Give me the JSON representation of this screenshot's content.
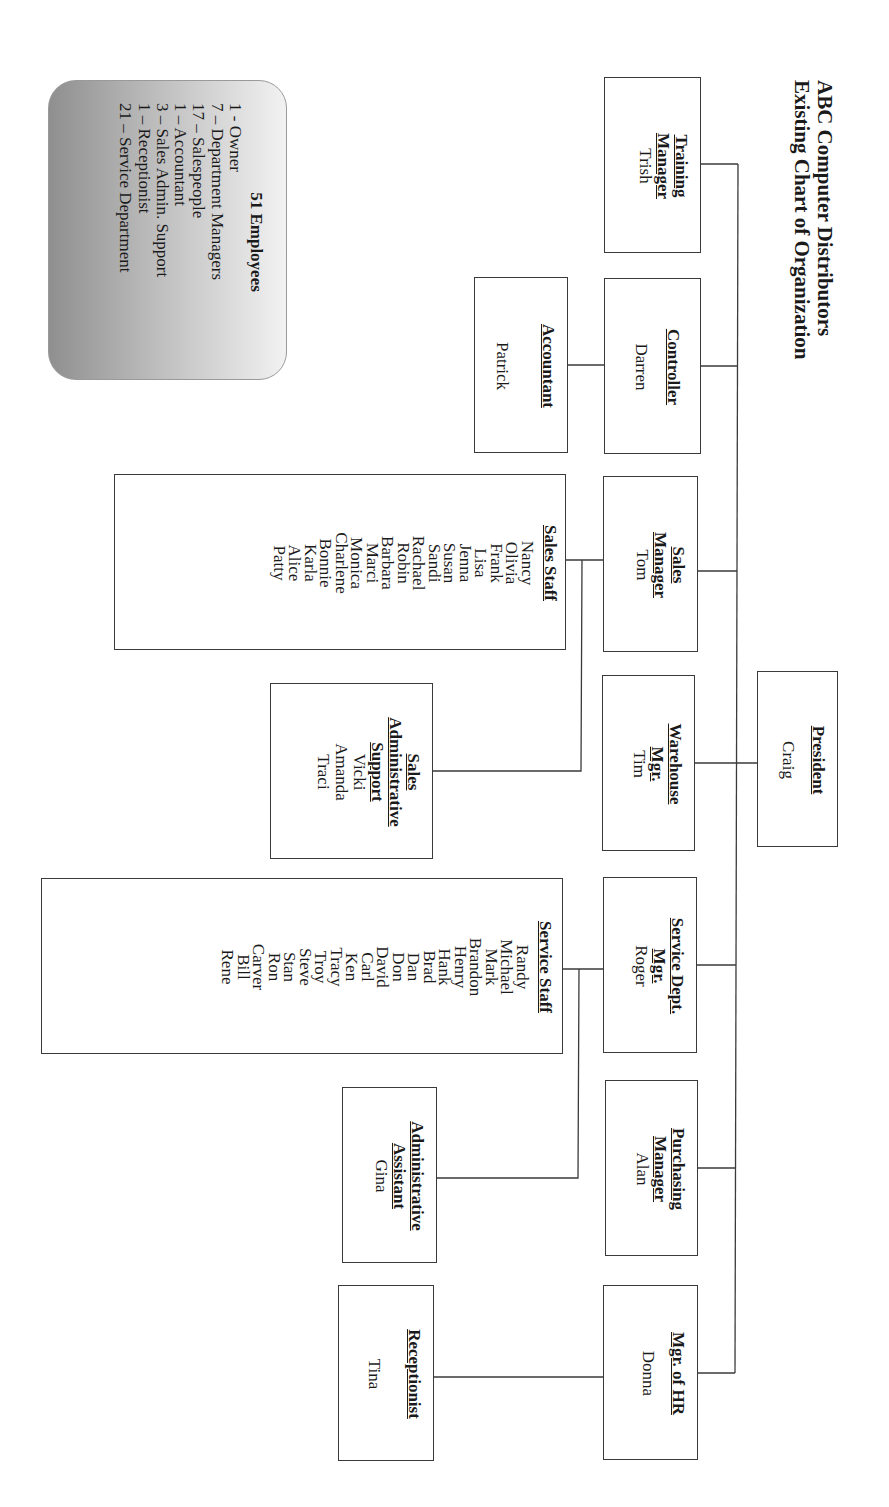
{
  "heading": {
    "line1": "ABC Computer Distributors",
    "line2": "Existing Chart of Organization"
  },
  "summary": {
    "title": "51  Employees",
    "lines": [
      "1 - Owner",
      "7 – Department Managers",
      "17 – Salespeople",
      "1 – Accountant",
      "3 – Sales Admin.  Support",
      "1 – Receptionist",
      "21 – Service Department"
    ]
  },
  "org": {
    "president": {
      "title": "President",
      "name": "Craig"
    },
    "managers": [
      {
        "title_lines": [
          "Training",
          "Manager"
        ],
        "name": "Trish"
      },
      {
        "title_lines": [
          "Controller"
        ],
        "name": "Darren"
      },
      {
        "title_lines": [
          "Sales",
          "Manager"
        ],
        "name": "Tom"
      },
      {
        "title_lines": [
          "Warehouse",
          "Mgr."
        ],
        "name": "Tim"
      },
      {
        "title_lines": [
          "Service Dept.",
          "Mgr."
        ],
        "name": "Roger"
      },
      {
        "title_lines": [
          "Purchasing",
          "Manager"
        ],
        "name": "Alan"
      },
      {
        "title_lines": [
          "Mgr. of HR"
        ],
        "name": "Donna"
      }
    ],
    "accountant": {
      "title": "Accountant",
      "name": "Patrick"
    },
    "sales_staff": {
      "title": "Sales Staff",
      "names": [
        "Nancy",
        "Olivia",
        "Frank",
        "Lisa",
        "Jenna",
        "Susan",
        "Sandi",
        "Rachael",
        "Robin",
        "Barbara",
        "Marci",
        "Monica",
        "Charlene",
        "Bonnie",
        "Karla",
        "Alice",
        "Patty"
      ]
    },
    "sales_admin_support": {
      "title_lines": [
        "Sales",
        "Administrative",
        "Support"
      ],
      "names": [
        "Vicki",
        "Amanda",
        "Traci"
      ]
    },
    "service_staff": {
      "title": "Service Staff",
      "names": [
        "Randy",
        "Michael",
        "Mark",
        "Brandon",
        "Henry",
        "Hank",
        "Brad",
        "Dan",
        "Don",
        "David",
        "Carl",
        "Ken",
        "Tracy",
        "Troy",
        "Steve",
        "Stan",
        "Ron",
        "Carver",
        "Bill",
        "Rene"
      ]
    },
    "admin_assistant": {
      "title_lines": [
        "Administrative",
        "Assistant"
      ],
      "name": "Gina"
    },
    "receptionist": {
      "title": "Receptionist",
      "name": "Tina"
    }
  },
  "colors": {
    "line": "#3a3a3a",
    "summary_gradient_dark": "#8f8f8f",
    "summary_gradient_light": "#f2f2f2"
  }
}
